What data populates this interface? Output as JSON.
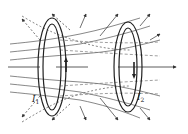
{
  "diagram": {
    "loops": [
      {
        "id": "loop-1",
        "label": "I",
        "subscript": "1",
        "line_style": "solid"
      },
      {
        "id": "loop-2",
        "label": "I",
        "subscript": "2",
        "line_style": "dashed"
      }
    ],
    "colors": {
      "ink": "#222222",
      "field_solid": "#555555",
      "field_dashed": "#777777",
      "background": "#ffffff"
    }
  }
}
